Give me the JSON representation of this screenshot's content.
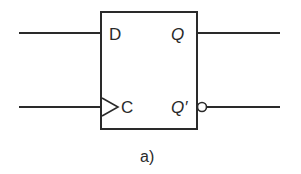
{
  "diagram": {
    "type": "D flip-flop schematic symbol",
    "inputs": [
      {
        "id": "D",
        "label": "D"
      },
      {
        "id": "C",
        "label": "C",
        "clock_edge_indicator": true
      }
    ],
    "outputs": [
      {
        "id": "Q",
        "label": "Q",
        "inverted": false
      },
      {
        "id": "Qbar",
        "label": "Q′",
        "inverted": true
      }
    ],
    "caption": "a)",
    "colors": {
      "stroke": "#2a2a2a",
      "background": "#ffffff"
    }
  }
}
